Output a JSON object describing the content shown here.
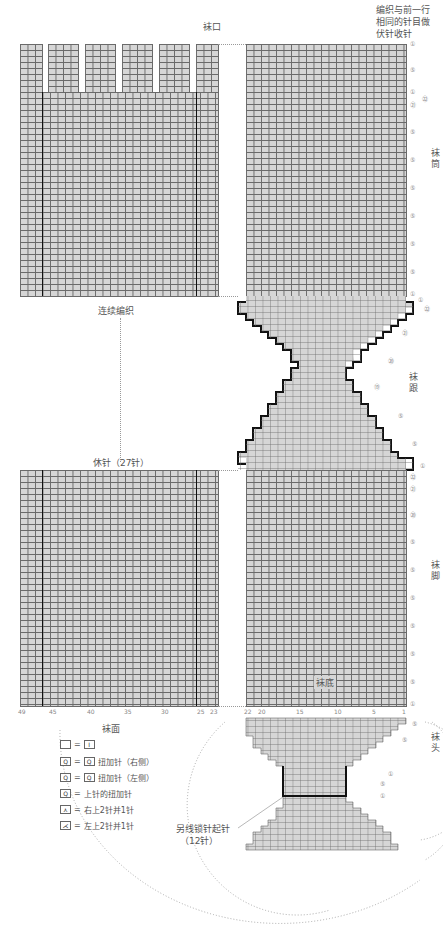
{
  "diagram": {
    "title_cuff": "袜口",
    "note_bind_off": [
      "编织与前一行",
      "相同的针目做",
      "伏针收针"
    ],
    "section_labels": {
      "leg": "袜筒",
      "heel": "袜跟",
      "foot": "袜脚",
      "sole": "袜底",
      "toe": "袜头",
      "instep": "袜面"
    },
    "continue_label": "连续编织",
    "hold_label": "休针（27针）",
    "provisional_cast_on": [
      "另线锁针起针",
      "（12针）"
    ],
    "x_axis_left": [
      "49",
      "45",
      "40",
      "35",
      "30",
      "25",
      "23"
    ],
    "x_axis_right": [
      "22",
      "20",
      "15",
      "10",
      "5",
      "1"
    ],
    "row_markers": {
      "cuff": [
        "①",
        "⑤",
        "①",
        "㉒",
        "㉑"
      ],
      "leg": [
        "⑤",
        "⑤",
        "⑤",
        "⑤",
        "⑤",
        "⑤",
        "⑤",
        "①"
      ],
      "heel": [
        "①",
        "㉒",
        "㉑",
        "⑳",
        "⑲",
        "⑤",
        "⑤",
        "①",
        "㉒"
      ],
      "foot": [
        "㉑",
        "⑳",
        "⑤",
        "⑤",
        "⑤",
        "⑤",
        "⑤",
        "⑤",
        "⑤",
        "①"
      ],
      "toe": [
        "⑤",
        "⑤",
        "①",
        "⑤",
        "①"
      ]
    },
    "legend": [
      {
        "symbol": "blank-square",
        "eq": "=",
        "meaning_box": "I",
        "text": ""
      },
      {
        "symbol": "twist-increase-right",
        "eq": "=",
        "meaning_box": "Q",
        "text": "扭加针（右侧）"
      },
      {
        "symbol": "twist-increase-left",
        "eq": "=",
        "meaning_box": "Q",
        "text": "扭加针（左侧）"
      },
      {
        "symbol": "purl-twist-increase",
        "eq": "=",
        "meaning_box": "",
        "text": "上针的扭加针"
      },
      {
        "symbol": "right-over-k2tog",
        "eq": "=",
        "meaning_box": "",
        "text": "右上2针并1针"
      },
      {
        "symbol": "left-over-k2tog",
        "eq": "=",
        "meaning_box": "",
        "text": "左上2针并1针"
      }
    ]
  }
}
